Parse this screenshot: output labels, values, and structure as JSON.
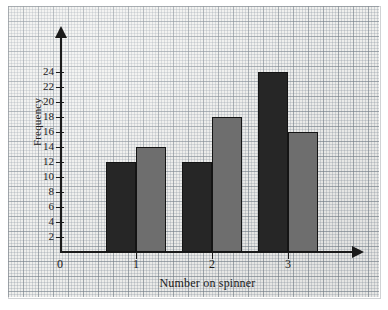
{
  "chart_data": {
    "type": "bar",
    "title": "",
    "xlabel": "Number on spinner",
    "ylabel": "Frequency",
    "categories": [
      "1",
      "2",
      "3"
    ],
    "series": [
      {
        "name": "dark",
        "color": "#262626",
        "values": [
          12,
          12,
          24
        ]
      },
      {
        "name": "light",
        "color": "#6e6e6e",
        "values": [
          14,
          18,
          16
        ]
      }
    ],
    "ylim": [
      0,
      24
    ],
    "ytick_step": 2,
    "ytick_labels": [
      "2",
      "4",
      "6",
      "8",
      "10",
      "12",
      "14",
      "16",
      "18",
      "20",
      "22",
      "24"
    ],
    "ytick_values": [
      2,
      4,
      6,
      8,
      10,
      12,
      14,
      16,
      18,
      20,
      22,
      24
    ],
    "xtick_labels": [
      "0",
      "1",
      "2",
      "3"
    ],
    "xtick_values": [
      0,
      1,
      2,
      3
    ],
    "grid": true,
    "grid_style": "graph-paper",
    "legend": "none",
    "axis_arrows": true,
    "origin_label": "0"
  },
  "colors": {
    "bar_dark": "#262626",
    "bar_light": "#6e6e6e",
    "axis": "#1a1a1a",
    "paper": "#f2f2f0",
    "grid_fine": "#8c96a0",
    "grid_heavy": "#78828c"
  }
}
